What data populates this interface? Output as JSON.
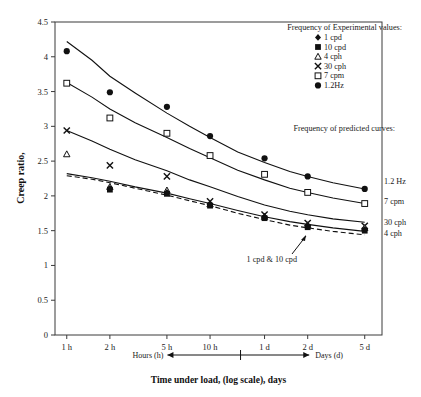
{
  "chart_data": {
    "type": "scatter",
    "title": "",
    "xlabel": "Time under load, (log scale), days",
    "ylabel": "Creep ratio,",
    "xscale": "log",
    "grid": false,
    "ylim": [
      0,
      4.5
    ],
    "yticks": [
      "0",
      "0.5",
      "1",
      "1.5",
      "2",
      "2.5",
      "3",
      "3.5",
      "4",
      "4.5"
    ],
    "ytick_values": [
      0,
      0.5,
      1,
      1.5,
      2,
      2.5,
      3,
      3.5,
      4,
      4.5
    ],
    "xticks": [
      "1 h",
      "2 h",
      "5 h",
      "10 h",
      "1 d",
      "2 d",
      "5 d"
    ],
    "xtick_values": [
      0.04167,
      0.08333,
      0.20833,
      0.41667,
      1,
      2,
      5
    ],
    "axis_range_left_label": "Hours (h)",
    "axis_range_right_label": "Days (d)",
    "legend_title_experimental": "Frequency of Experimental values:",
    "legend_title_predicted": "Frequency of predicted curves:",
    "legend": [
      {
        "marker": "diamond",
        "label": "1 cpd"
      },
      {
        "marker": "filled-square",
        "label": "10 cpd"
      },
      {
        "marker": "open-triangle",
        "label": "4 cph"
      },
      {
        "marker": "cross",
        "label": "30 cph"
      },
      {
        "marker": "open-square",
        "label": "7 cpm"
      },
      {
        "marker": "filled-circle",
        "label": "1.2Hz"
      }
    ],
    "curve_labels": [
      {
        "label": "1.2 Hz",
        "y": 2.22
      },
      {
        "label": "7 cpm",
        "y": 1.93
      },
      {
        "label": "30 cph",
        "y": 1.62
      },
      {
        "label": "4 cph",
        "y": 1.47
      }
    ],
    "annotation": "1 cpd & 10 cpd",
    "series": [
      {
        "name": "1.2Hz",
        "marker": "filled-circle",
        "x": [
          0.04167,
          0.08333,
          0.20833,
          0.41667,
          1,
          2,
          5
        ],
        "values": [
          4.08,
          3.49,
          3.28,
          2.86,
          2.54,
          2.28,
          2.1
        ]
      },
      {
        "name": "7 cpm",
        "marker": "open-square",
        "x": [
          0.04167,
          0.08333,
          0.20833,
          0.41667,
          1,
          2,
          5
        ],
        "values": [
          3.62,
          3.12,
          2.9,
          2.58,
          2.31,
          2.05,
          1.89
        ]
      },
      {
        "name": "30 cph",
        "marker": "cross",
        "x": [
          0.04167,
          0.08333,
          0.20833,
          0.41667,
          1,
          2,
          5
        ],
        "values": [
          2.94,
          2.44,
          2.28,
          1.92,
          1.73,
          1.61,
          1.57
        ]
      },
      {
        "name": "4 cph",
        "marker": "open-triangle",
        "x": [
          0.04167,
          0.08333,
          0.20833,
          0.41667,
          1,
          2,
          5
        ],
        "values": [
          2.6,
          2.13,
          2.08,
          1.88,
          1.7,
          1.58,
          1.54
        ]
      },
      {
        "name": "10 cpd",
        "marker": "filled-square",
        "x": [
          0.08333,
          0.20833,
          0.41667,
          1,
          2,
          5
        ],
        "values": [
          2.09,
          2.03,
          1.86,
          1.68,
          1.55,
          1.5
        ]
      },
      {
        "name": "1 cpd",
        "marker": "diamond",
        "x": [
          0.08333,
          0.20833,
          0.41667,
          1,
          2,
          5
        ],
        "values": [
          2.11,
          2.05,
          1.88,
          1.7,
          1.57,
          1.52
        ]
      }
    ],
    "predicted_curves": [
      {
        "name": "1.2 Hz",
        "style": "solid",
        "x": [
          0.04167,
          0.0625,
          0.08333,
          0.125,
          0.20833,
          0.3,
          0.41667,
          0.65,
          1,
          1.5,
          2,
          3,
          5
        ],
        "y": [
          4.22,
          3.95,
          3.72,
          3.48,
          3.19,
          3.0,
          2.84,
          2.63,
          2.48,
          2.35,
          2.28,
          2.19,
          2.1
        ]
      },
      {
        "name": "7 cpm",
        "style": "solid",
        "x": [
          0.04167,
          0.0625,
          0.08333,
          0.125,
          0.20833,
          0.3,
          0.41667,
          0.65,
          1,
          1.5,
          2,
          3,
          5
        ],
        "y": [
          3.63,
          3.42,
          3.25,
          3.05,
          2.84,
          2.68,
          2.55,
          2.37,
          2.23,
          2.11,
          2.05,
          1.97,
          1.89
        ]
      },
      {
        "name": "30 cph",
        "style": "solid",
        "x": [
          0.04167,
          0.0625,
          0.08333,
          0.125,
          0.20833,
          0.3,
          0.41667,
          0.65,
          1,
          1.5,
          2,
          3,
          5
        ],
        "y": [
          2.94,
          2.79,
          2.67,
          2.52,
          2.36,
          2.23,
          2.13,
          1.99,
          1.87,
          1.78,
          1.73,
          1.67,
          1.62
        ]
      },
      {
        "name": "4 cph",
        "style": "solid",
        "x": [
          0.04167,
          0.0625,
          0.08333,
          0.125,
          0.20833,
          0.3,
          0.41667,
          0.65,
          1,
          1.5,
          2,
          3,
          5
        ],
        "y": [
          2.32,
          2.26,
          2.21,
          2.13,
          2.04,
          1.96,
          1.89,
          1.79,
          1.7,
          1.63,
          1.59,
          1.54,
          1.49
        ]
      },
      {
        "name": "1 cpd & 10 cpd",
        "style": "dashed",
        "x": [
          0.04167,
          0.0625,
          0.08333,
          0.125,
          0.20833,
          0.3,
          0.41667,
          0.65,
          1,
          1.5,
          2,
          3,
          5
        ],
        "y": [
          2.29,
          2.24,
          2.19,
          2.11,
          2.01,
          1.93,
          1.86,
          1.75,
          1.66,
          1.58,
          1.54,
          1.49,
          1.44
        ]
      }
    ]
  }
}
